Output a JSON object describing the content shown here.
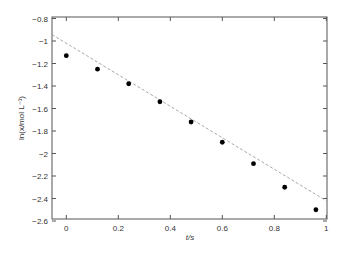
{
  "chart_data": {
    "type": "scatter",
    "title": "",
    "xlabel": "t/s",
    "ylabel": "ln(x/mol L⁻¹)",
    "xlim": [
      -0.05,
      1.0
    ],
    "ylim": [
      -2.6,
      -0.8
    ],
    "xticks": [
      0,
      0.2,
      0.4,
      0.6,
      0.8,
      1
    ],
    "xtick_labels": [
      "0",
      "0.2",
      "0.4",
      "0.6",
      "0.8",
      "1"
    ],
    "yticks": [
      -0.8,
      -1,
      -1.2,
      -1.4,
      -1.6,
      -1.8,
      -2,
      -2.2,
      -2.4,
      -2.6
    ],
    "ytick_labels": [
      "-0.8",
      "-1",
      "-1.2",
      "-1.4",
      "-1.6",
      "-1.8",
      "-2",
      "-2.2",
      "-2.4",
      "-2.6"
    ],
    "grid": false,
    "legend": null,
    "series": [
      {
        "name": "data",
        "kind": "scatter",
        "marker": "filled-circle",
        "color": "#000000",
        "x": [
          0.0,
          0.12,
          0.24,
          0.36,
          0.48,
          0.6,
          0.72,
          0.84,
          0.96
        ],
        "y": [
          -1.13,
          -1.25,
          -1.38,
          -1.54,
          -1.72,
          -1.9,
          -2.09,
          -2.3,
          -2.5
        ]
      },
      {
        "name": "linear fit",
        "kind": "line",
        "style": "dashed",
        "color": "#aaaaaa",
        "slope": -1.4,
        "intercept": -1.02,
        "x": [
          -0.05,
          1.0
        ],
        "y": [
          -0.95,
          -2.42
        ]
      }
    ]
  }
}
